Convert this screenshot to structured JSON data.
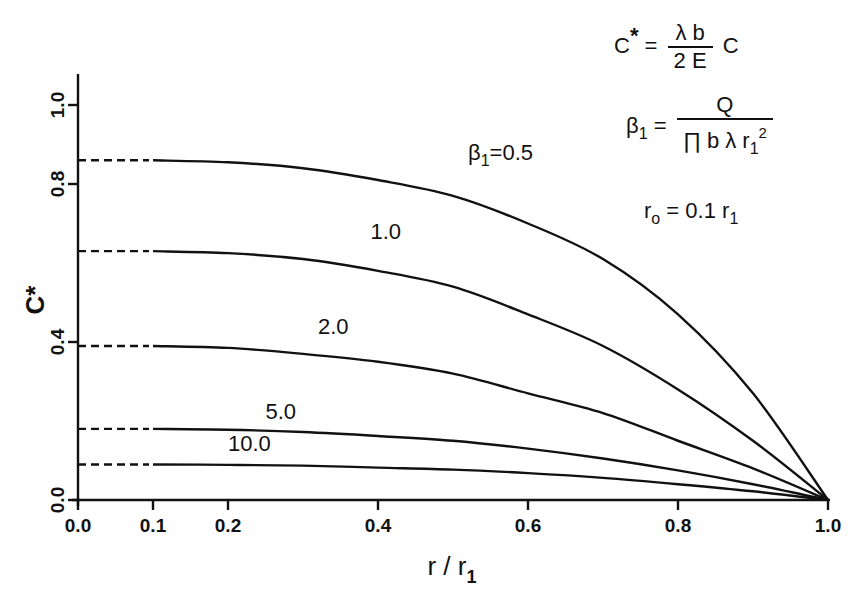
{
  "chart_data": {
    "type": "line",
    "title": "",
    "xlabel": "r / r1",
    "ylabel": "C*",
    "xlim": [
      0.0,
      1.0
    ],
    "ylim": [
      0.0,
      1.1
    ],
    "grid": false,
    "x_ticks": [
      {
        "value": 0.0,
        "label": "0.0"
      },
      {
        "value": 0.1,
        "label": "0.1"
      },
      {
        "value": 0.2,
        "label": "0.2"
      },
      {
        "value": 0.4,
        "label": "0.4"
      },
      {
        "value": 0.6,
        "label": "0.6"
      },
      {
        "value": 0.8,
        "label": "0.8"
      },
      {
        "value": 1.0,
        "label": "1.0"
      }
    ],
    "y_ticks": [
      {
        "value": 0.0,
        "label": "0.0"
      },
      {
        "value": 0.4,
        "label": "0.4"
      },
      {
        "value": 0.8,
        "label": "0.8"
      },
      {
        "value": 1.0,
        "label": "1.0"
      }
    ],
    "dashed_region": {
      "x_from": 0.0,
      "x_to": 0.1,
      "note": "dashed extension for r < r0"
    },
    "x": [
      0.1,
      0.2,
      0.3,
      0.4,
      0.5,
      0.6,
      0.7,
      0.8,
      0.9,
      1.0
    ],
    "series": [
      {
        "name": "β1=0.5",
        "label": "β1=0.5",
        "label_pos": [
          0.52,
          0.86
        ],
        "values": [
          0.86,
          0.855,
          0.84,
          0.81,
          0.77,
          0.7,
          0.61,
          0.47,
          0.27,
          0.0
        ]
      },
      {
        "name": "β1=1.0",
        "label": "1.0",
        "label_pos": [
          0.39,
          0.66
        ],
        "values": [
          0.63,
          0.625,
          0.61,
          0.58,
          0.54,
          0.47,
          0.39,
          0.28,
          0.15,
          0.0
        ]
      },
      {
        "name": "β1=2.0",
        "label": "2.0",
        "label_pos": [
          0.32,
          0.42
        ],
        "values": [
          0.39,
          0.385,
          0.37,
          0.35,
          0.32,
          0.27,
          0.22,
          0.15,
          0.08,
          0.0
        ]
      },
      {
        "name": "β1=5.0",
        "label": "5.0",
        "label_pos": [
          0.25,
          0.205
        ],
        "values": [
          0.18,
          0.178,
          0.172,
          0.162,
          0.15,
          0.13,
          0.105,
          0.075,
          0.04,
          0.0
        ]
      },
      {
        "name": "β1=10.0",
        "label": "10.0",
        "label_pos": [
          0.2,
          0.125
        ],
        "values": [
          0.09,
          0.089,
          0.087,
          0.082,
          0.077,
          0.068,
          0.056,
          0.04,
          0.022,
          0.0
        ]
      }
    ],
    "annotations": [
      "C* = (λ b / 2 E) C",
      "β1 = Q / (π b λ r1²)",
      "r0 = 0.1 r1"
    ]
  },
  "formulas": {
    "c_star": {
      "lhs": "C",
      "lhs_sup": "*",
      "eq": "=",
      "num": "λ  b",
      "den": "2  E",
      "rhs": "C"
    },
    "beta": {
      "lhs": "β",
      "lhs_sub": "1",
      "eq": "=",
      "num": "Q",
      "den_main": "∏  b  λ  r",
      "den_sub": "1",
      "den_sup": "2"
    },
    "r0": {
      "lhs": "r",
      "lhs_sub": "o",
      "eq": "=",
      "rhs": "0.1  r",
      "rhs_sub": "1"
    }
  },
  "axis_labels": {
    "x_main": "r  /  r",
    "x_sub": "1",
    "y_main": "C*"
  }
}
